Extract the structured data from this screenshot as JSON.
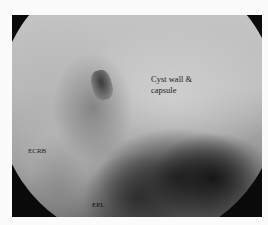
{
  "image": {
    "description": "Arthroscopic view of wrist with dorsal ganglion",
    "labels": {
      "cyst": "Cyst wall &",
      "cyst_line2": "capsule",
      "ecrb": "ECRB",
      "epl": "EPL"
    }
  }
}
